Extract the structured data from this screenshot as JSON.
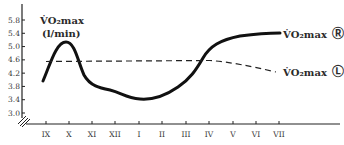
{
  "chart_data": {
    "type": "line",
    "title": "",
    "ylabel": "V̇O₂max",
    "ylabel_unit": "(l/min)",
    "xlabel": "",
    "ylim": [
      2.8,
      6.0
    ],
    "y_ticks": [
      "5.8",
      "5.4",
      "5.0",
      "4.6",
      "4.2",
      "3.8",
      "3.4",
      "3.0"
    ],
    "y_tick_values": [
      5.8,
      5.4,
      5.0,
      4.6,
      4.2,
      3.8,
      3.4,
      3.0
    ],
    "categories": [
      "IX",
      "X",
      "XI",
      "XII",
      "I",
      "II",
      "III",
      "IV",
      "V",
      "VI",
      "VII"
    ],
    "grid": false,
    "axis_break": true,
    "series": [
      {
        "name": "V̇O₂max Ⓡ",
        "style": "solid",
        "values": [
          3.95,
          5.15,
          3.8,
          3.6,
          3.4,
          3.5,
          3.85,
          4.6,
          5.2,
          5.35,
          5.4
        ]
      },
      {
        "name": "V̇O₂max Ⓛ",
        "style": "dashed",
        "values": [
          4.55,
          4.56,
          4.57,
          4.58,
          4.58,
          4.59,
          4.6,
          4.6,
          4.45,
          4.35,
          4.3
        ]
      }
    ],
    "legend": [
      {
        "label": "V̇O₂max",
        "marker": "Ⓡ",
        "series": 0
      },
      {
        "label": "V̇O₂max",
        "marker": "Ⓛ",
        "series": 1
      }
    ],
    "legend_position": "right, inline at line ends"
  }
}
